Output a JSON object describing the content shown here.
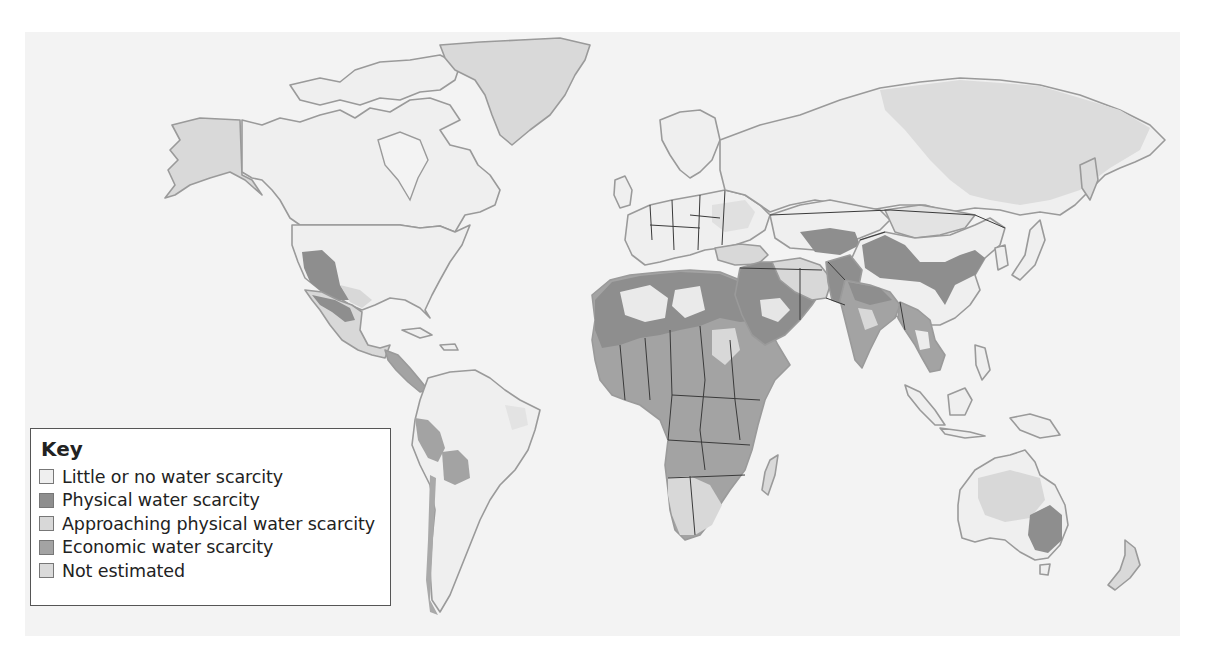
{
  "map": {
    "type": "choropleth",
    "subject": "World water scarcity",
    "background_color": "#f3f3f3",
    "coastline_color": "#9a9a9a",
    "border_color": "#3a3a3a"
  },
  "legend": {
    "title": "Key",
    "items": [
      {
        "key": "little",
        "label": "Little or no water scarcity",
        "color": "#efefef"
      },
      {
        "key": "physical",
        "label": "Physical water scarcity",
        "color": "#8e8e8e"
      },
      {
        "key": "approaching",
        "label": "Approaching physical water scarcity",
        "color": "#d8d8d8"
      },
      {
        "key": "economic",
        "label": "Economic water scarcity",
        "color": "#a3a3a3"
      },
      {
        "key": "not_estimated",
        "label": "Not estimated",
        "color": "#dadada"
      }
    ]
  },
  "regions": {
    "physical": [
      "Western USA",
      "Northern Mexico",
      "North Africa",
      "Arabian Peninsula",
      "Middle East",
      "Pakistan",
      "Northern India",
      "Northern China",
      "Central Asia",
      "South-east Australia",
      "Peru/Chile coast"
    ],
    "economic": [
      "Sub-Saharan Africa",
      "Bolivia",
      "Peru",
      "Central America",
      "Bangladesh",
      "Myanmar",
      "Cambodia",
      "India (south/east)"
    ],
    "approaching": [
      "Southern Africa",
      "Iran",
      "Turkey",
      "Central Mexico",
      "Eastern Europe",
      "Mongolia border region",
      "Australia interior"
    ],
    "not_estimated": [
      "Greenland",
      "Alaska",
      "Eastern Russia",
      "Madagascar",
      "New Zealand"
    ]
  }
}
